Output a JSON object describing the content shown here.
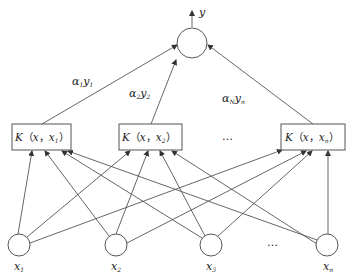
{
  "diagram": {
    "type": "svm-network",
    "output": {
      "label": "y"
    },
    "weights": [
      {
        "alpha": "α",
        "alpha_sub": "1",
        "y": "y",
        "y_sub": "1"
      },
      {
        "alpha": "α",
        "alpha_sub": "2",
        "y": "y",
        "y_sub": "2"
      },
      {
        "alpha": "α",
        "alpha_sub": "N",
        "y": "y",
        "y_sub": "n"
      }
    ],
    "kernels": [
      {
        "K": "K",
        "open": "（",
        "x": "x",
        "sep": "，",
        "xi": "x",
        "sub": "1",
        "close": "）"
      },
      {
        "K": "K",
        "open": "（",
        "x": "x",
        "sep": "，",
        "xi": "x",
        "sub": "2",
        "close": "）"
      },
      {
        "K": "K",
        "open": "（",
        "x": "x",
        "sep": "，",
        "xi": "x",
        "sub": "n",
        "close": "）"
      }
    ],
    "kernel_ellipsis": "…",
    "inputs": [
      {
        "x": "x",
        "sub": "1"
      },
      {
        "x": "x",
        "sub": "2"
      },
      {
        "x": "x",
        "sub": "3"
      },
      {
        "x": "x",
        "sub": "n"
      }
    ],
    "input_ellipsis": "…"
  }
}
